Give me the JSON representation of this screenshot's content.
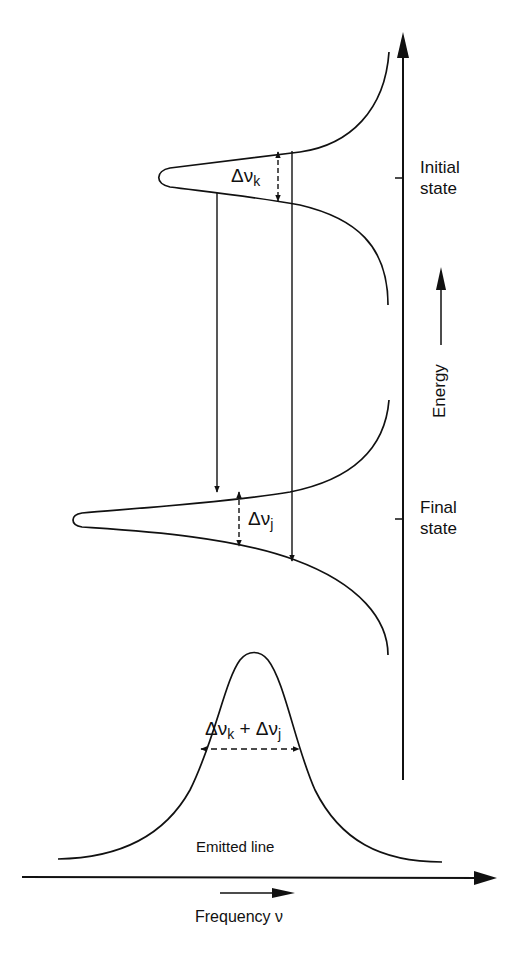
{
  "diagram": {
    "type": "energy-level line broadening",
    "labels": {
      "initial_state": "Initial state",
      "initial_state_line1": "Initial",
      "initial_state_line2": "state",
      "final_state": "Final state",
      "final_state_line1": "Final",
      "final_state_line2": "state",
      "energy_axis": "Energy",
      "emitted_line": "Emitted line",
      "frequency_axis": "Frequency ν"
    },
    "widths": {
      "delta_k": "Δν",
      "delta_k_sub": "k",
      "delta_j": "Δν",
      "delta_j_sub": "j",
      "sum_prefix": "Δν",
      "sum_k_sub": "k",
      "sum_plus": " + Δν",
      "sum_j_sub": "j"
    },
    "elements": [
      "initial-state-lorentzian-profile",
      "final-state-lorentzian-profile",
      "transition-arrow-center",
      "transition-arrow-wing",
      "emitted-line-profile",
      "energy-axis-arrow",
      "frequency-axis-arrow"
    ],
    "colors": {
      "line": "#111111",
      "background": "#ffffff"
    }
  }
}
